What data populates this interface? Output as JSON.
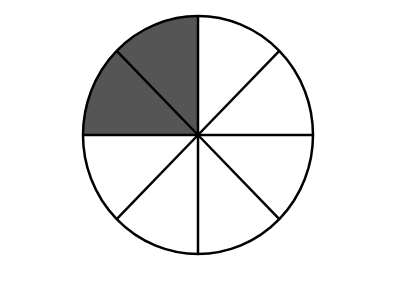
{
  "diagram": {
    "type": "fraction-circle",
    "total_slices": 8,
    "shaded_slices": 2,
    "shaded_fraction": "2/8",
    "shaded_positions": [
      "upper-left-top",
      "upper-left-bottom"
    ],
    "colors": {
      "shaded": "#555555",
      "unshaded": "#ffffff",
      "stroke": "#000000",
      "background": "#ffffff"
    }
  }
}
